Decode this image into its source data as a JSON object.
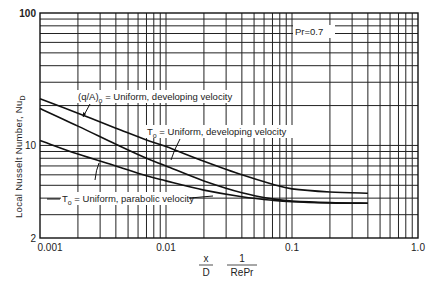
{
  "chart_data": {
    "type": "line",
    "title": "",
    "xlabel": "x/D · 1/(RePr)",
    "xlabel_parts": {
      "num1": "x",
      "den1": "D",
      "num2": "1",
      "den2": "RePr"
    },
    "ylabel": "Local Nusselt Number, Nu_D",
    "xscale": "log",
    "yscale": "log",
    "xlim": [
      0.001,
      1.0
    ],
    "ylim": [
      2,
      100
    ],
    "x_tick_labels": [
      "0.001",
      "0.01",
      "0.1",
      "1.0"
    ],
    "y_tick_labels": [
      "2",
      "10",
      "100"
    ],
    "grid": true,
    "legend_position": "inline annotations",
    "annotations": [
      {
        "text": "Pr=0.7"
      },
      {
        "text": "(q/A)ₒ = Uniform, developing velocity",
        "series": 0
      },
      {
        "text": "Tₒ = Uniform, developing velocity",
        "series": 1
      },
      {
        "text": "Tₒ = Uniform, parabolic velocity",
        "series": 2
      }
    ],
    "x": [
      0.001,
      0.002,
      0.004,
      0.007,
      0.01,
      0.02,
      0.04,
      0.07,
      0.1,
      0.2,
      0.4
    ],
    "series": [
      {
        "name": "(q/A)o = Uniform, developing velocity",
        "values": [
          22.5,
          17.5,
          13.5,
          11.0,
          9.8,
          7.6,
          6.0,
          5.1,
          4.7,
          4.45,
          4.36
        ]
      },
      {
        "name": "To = Uniform, developing velocity",
        "values": [
          19.0,
          14.0,
          10.2,
          8.0,
          7.0,
          5.4,
          4.4,
          3.95,
          3.8,
          3.7,
          3.66
        ]
      },
      {
        "name": "To = Uniform, parabolic velocity",
        "values": [
          10.9,
          8.6,
          7.0,
          5.9,
          5.4,
          4.6,
          4.1,
          3.85,
          3.75,
          3.68,
          3.66
        ]
      }
    ]
  },
  "labels": {
    "y_title_main": "Local  Nusselt  Number, Nu",
    "y_title_sub": "D",
    "pr": "Pr=0.7",
    "ann1_a": "(q/A)",
    "ann1_sub": "o",
    "ann1_b": " = Uniform, developing velocity",
    "ann2_a": "T",
    "ann2_sub": "o",
    "ann2_b": " = Uniform, developing velocity",
    "ann3_a": "T",
    "ann3_sub": "o",
    "ann3_b": " = Uniform, parabolic velocity",
    "x_num1": "x",
    "x_den1": "D",
    "x_num2": "1",
    "x_den2": "RePr"
  },
  "colors": {
    "ink": "#111111",
    "background": "#ffffff"
  }
}
